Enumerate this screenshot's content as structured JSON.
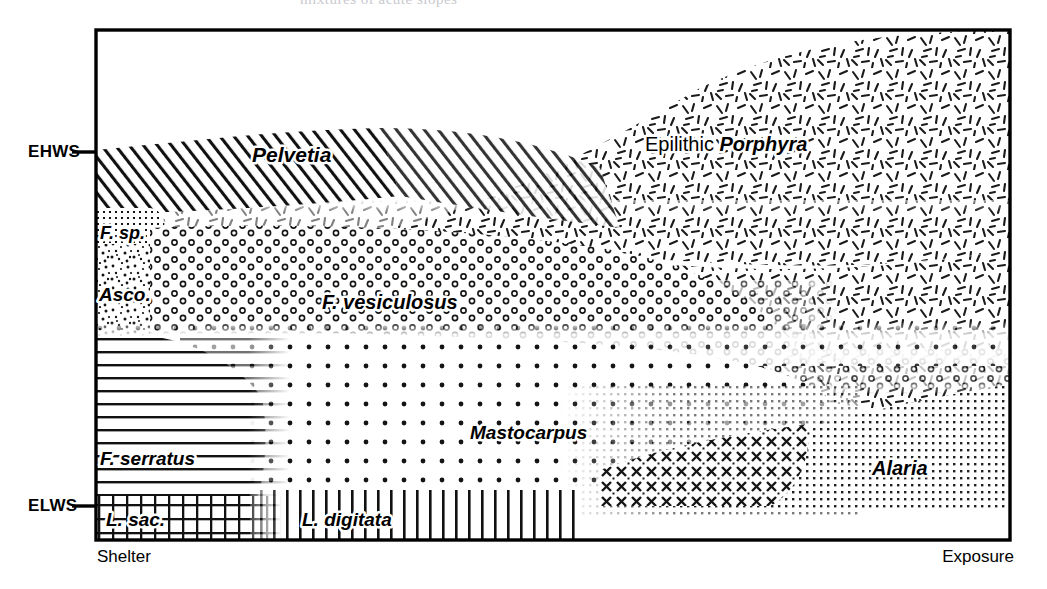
{
  "figure": {
    "type": "zonation-diagram",
    "top_cropped_title_fragment": "mixtures of acute slopes",
    "frame": {
      "x": 96,
      "y": 30,
      "width": 914,
      "height": 510,
      "border_color": "#000000"
    },
    "background": "#ffffff"
  },
  "axis": {
    "vertical_levels": [
      {
        "id": "ehws",
        "label": "EHWS",
        "y": 152
      },
      {
        "id": "elws",
        "label": "ELWS",
        "y": 506
      }
    ],
    "horizontal_ends": [
      {
        "id": "shelter",
        "label": "Shelter",
        "align": "left"
      },
      {
        "id": "exposure",
        "label": "Exposure",
        "align": "right"
      }
    ]
  },
  "zones": [
    {
      "id": "pelvetia",
      "label": "Pelvetia",
      "italic": true,
      "pattern": "diagonal-hatch",
      "x": 252,
      "y": 155
    },
    {
      "id": "porphyra",
      "label": "Porphyra",
      "italic": true,
      "prefix": "Epilithic ",
      "pattern": "random-dashes",
      "x": 712,
      "y": 144
    },
    {
      "id": "f-sp",
      "label": "F. sp.",
      "italic": true,
      "pattern": "fine-dot-grid",
      "x": 101,
      "y": 232
    },
    {
      "id": "asco",
      "label": "Asco.",
      "italic": true,
      "pattern": "speckle",
      "x": 99,
      "y": 294
    },
    {
      "id": "f-vesiculosus",
      "label": "F. vesiculosus",
      "italic": true,
      "pattern": "open-circles",
      "x": 322,
      "y": 302
    },
    {
      "id": "f-serratus",
      "label": "F. serratus",
      "italic": true,
      "pattern": "horizontal-lines",
      "x": 100,
      "y": 458
    },
    {
      "id": "mastocarpus",
      "label": "Mastocarpus",
      "italic": true,
      "pattern": "dot-grid",
      "x": 470,
      "y": 432
    },
    {
      "id": "alaria",
      "label": "Alaria",
      "italic": true,
      "pattern": "dense-stipple",
      "x": 872,
      "y": 468
    },
    {
      "id": "l-sac",
      "label": "L. sac.",
      "italic": true,
      "pattern": "cross-grid",
      "x": 106,
      "y": 519
    },
    {
      "id": "l-digitata",
      "label": "L. digitata",
      "italic": true,
      "pattern": "vertical-lines",
      "x": 302,
      "y": 519
    }
  ]
}
